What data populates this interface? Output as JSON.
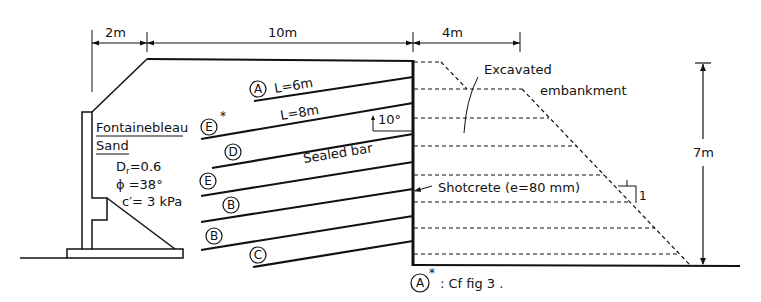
{
  "diagram": {
    "dimensions": {
      "left_width": "2m",
      "reinforced_width": "10m",
      "embankment_top_width": "4m",
      "wall_height": "7m"
    },
    "soil": {
      "name_line1": "Fontainebleau",
      "name_line2": "Sand",
      "dr": "Dr=0.6",
      "dr_main": "D",
      "dr_sub": "r",
      "dr_value": "=0.6",
      "phi": "ϕ =38°",
      "cohesion": "c′= 3 kPa"
    },
    "nail_labels": {
      "length_a": "L=6m",
      "length_e": "L=8m",
      "angle": "10°",
      "sealed_bar": "Sealed bar"
    },
    "nails": [
      {
        "id": "A",
        "star": false
      },
      {
        "id": "E",
        "star": true
      },
      {
        "id": "D",
        "star": false
      },
      {
        "id": "E",
        "star": false
      },
      {
        "id": "B",
        "star": false
      },
      {
        "id": "B",
        "star": false
      },
      {
        "id": "C",
        "star": false
      }
    ],
    "annotations": {
      "excavated_line1": "Excavated",
      "excavated_line2": "embankment",
      "shotcrete": "Shotcrete (e=80 mm)",
      "slope_h": "1",
      "slope_v": "1",
      "footnote_symbol": "A",
      "footnote_star": "*",
      "footnote_text": ": Cf  fig 3 ."
    },
    "colors": {
      "ink": "#111111",
      "background": "#ffffff"
    }
  }
}
